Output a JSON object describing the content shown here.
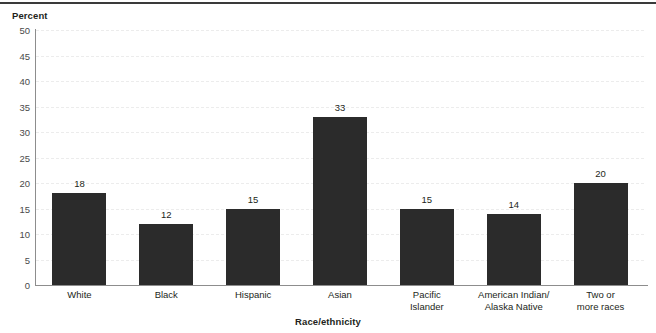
{
  "chart_data": {
    "type": "bar",
    "title": "",
    "xlabel": "Race/ethnicity",
    "ylabel": "Percent",
    "categories": [
      "White",
      "Black",
      "Hispanic",
      "Asian",
      "Pacific\nIslander",
      "American Indian/\nAlaska Native",
      "Two or\nmore races"
    ],
    "values": [
      18,
      12,
      15,
      33,
      15,
      14,
      20
    ],
    "data_labels": [
      "18",
      "12",
      "15",
      "33",
      "15",
      "14",
      "20"
    ],
    "ylim": [
      0,
      50
    ],
    "ytick_labels": [
      "50",
      "45",
      "40",
      "35",
      "30",
      "25",
      "20",
      "15",
      "10",
      "5",
      "0"
    ],
    "ytick_values": [
      50,
      45,
      40,
      35,
      30,
      25,
      20,
      15,
      10,
      5,
      0
    ],
    "grid": true,
    "legend": "none",
    "bar_color": "#2b2b2b",
    "grid_color": "#ececec",
    "axis_color": "#8d8d8d"
  },
  "axes": {
    "y_title": "Percent",
    "x_title": "Race/ethnicity"
  }
}
